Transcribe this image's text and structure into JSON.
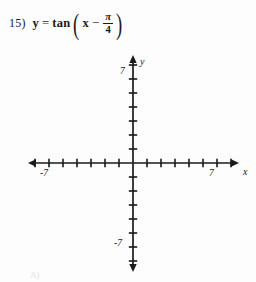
{
  "problem": {
    "number": "15)",
    "lhs": "y",
    "equals": "=",
    "function_name": "tan",
    "open_paren": "(",
    "close_paren": ")",
    "variable": "x",
    "operator": "−",
    "fraction_numerator": "π",
    "fraction_denominator": "4",
    "full_text": "15) y = tan(x − π/4)"
  },
  "graph": {
    "axis_labels": {
      "x": "x",
      "y": "y"
    },
    "tick_labels": {
      "x_positive": "7",
      "x_negative": "-7",
      "y_positive": "7",
      "y_negative": "-7"
    },
    "x_range": [
      -7,
      7
    ],
    "y_range": [
      -7,
      7
    ],
    "ticks_per_side": 7,
    "tick_spacing_px": 14,
    "origin": {
      "x": 133,
      "y": 163
    },
    "axis_color": "#1a1a1a",
    "has_curve": false,
    "grid": false
  },
  "footer": {
    "partial_mark": "A)"
  }
}
